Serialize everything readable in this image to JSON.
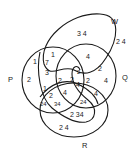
{
  "diagram": {
    "type": "venn",
    "sets": [
      {
        "name": "P",
        "label": "P"
      },
      {
        "name": "Q",
        "label": "Q"
      },
      {
        "name": "R",
        "label": "R"
      },
      {
        "name": "W",
        "label": "W"
      }
    ],
    "region_labels": [
      {
        "id": "w-only",
        "text": "3 4"
      },
      {
        "id": "outside-w",
        "text": "2 4"
      },
      {
        "id": "p-top",
        "text": "1"
      },
      {
        "id": "p-w-top",
        "text": "1"
      },
      {
        "id": "p-w-mid",
        "text": "7"
      },
      {
        "id": "p-w-3",
        "text": "3"
      },
      {
        "id": "p-only",
        "text": "2"
      },
      {
        "id": "w-q",
        "text": "4"
      },
      {
        "id": "q-right-2",
        "text": "2"
      },
      {
        "id": "q-only",
        "text": "4"
      },
      {
        "id": "q-inner-2",
        "text": "2"
      },
      {
        "id": "center-2a",
        "text": "2"
      },
      {
        "id": "center-4a",
        "text": "4"
      },
      {
        "id": "center-2b",
        "text": "2"
      },
      {
        "id": "left-1",
        "text": "1"
      },
      {
        "id": "left-2",
        "text": "2"
      },
      {
        "id": "mid-2",
        "text": "2"
      },
      {
        "id": "mid-4",
        "text": "4"
      },
      {
        "id": "q-r-4",
        "text": "4"
      },
      {
        "id": "bottom-24a",
        "text": "24"
      },
      {
        "id": "bottom-34",
        "text": "34"
      },
      {
        "id": "bottom-24b",
        "text": "24"
      },
      {
        "id": "lower-234",
        "text": "2 34"
      },
      {
        "id": "r-only",
        "text": "2 4"
      }
    ]
  }
}
